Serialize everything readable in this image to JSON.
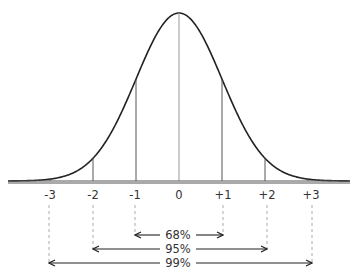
{
  "diagram": {
    "tick_labels": [
      "-3",
      "-2",
      "-1",
      "0",
      "+1",
      "+2",
      "+3"
    ],
    "ranges": [
      {
        "label": "68%",
        "from": "-1",
        "to": "+1"
      },
      {
        "label": "95%",
        "from": "-2",
        "to": "+2"
      },
      {
        "label": "99%",
        "from": "-3",
        "to": "+3"
      }
    ]
  },
  "colors": {
    "curve": "#222222",
    "lines": "#555555",
    "dashes": "#aaaaaa"
  }
}
